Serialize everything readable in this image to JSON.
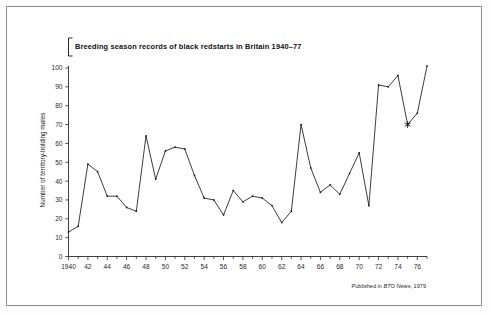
{
  "figure": {
    "title": "Breeding season records of black redstarts in Britain 1940–77",
    "credit_prefix": "Published in ",
    "credit_source": "BTO News",
    "credit_suffix": ", 1979",
    "background_color": "#ffffff",
    "frame_color": "#8e8e8e",
    "ink_color": "#111111"
  },
  "chart_data": {
    "type": "line",
    "title": "Breeding season records of black redstarts in Britain 1940–77",
    "xlabel": "",
    "ylabel": "Number of territory-holding males",
    "xlim": [
      1940,
      1977
    ],
    "ylim": [
      0,
      100
    ],
    "y_ticks": [
      0,
      10,
      20,
      30,
      40,
      50,
      60,
      70,
      80,
      90,
      100
    ],
    "x_ticks": [
      1940,
      1942,
      1944,
      1946,
      1948,
      1950,
      1952,
      1954,
      1956,
      1958,
      1960,
      1962,
      1964,
      1966,
      1968,
      1970,
      1972,
      1974,
      1976
    ],
    "x_tick_labels": [
      "1940",
      "42",
      "44",
      "46",
      "48",
      "50",
      "52",
      "54",
      "56",
      "58",
      "60",
      "62",
      "64",
      "66",
      "68",
      "70",
      "72",
      "74",
      "76"
    ],
    "x_minor_ticks_every": 1,
    "grid": false,
    "legend": false,
    "marker": "square",
    "annotations": [
      {
        "x": 1975,
        "y": 70,
        "marker": "asterisk",
        "note": "asterisk-marked data point"
      }
    ],
    "x": [
      1940,
      1941,
      1942,
      1943,
      1944,
      1945,
      1946,
      1947,
      1948,
      1949,
      1950,
      1951,
      1952,
      1953,
      1954,
      1955,
      1956,
      1957,
      1958,
      1959,
      1960,
      1961,
      1962,
      1963,
      1964,
      1965,
      1966,
      1967,
      1968,
      1969,
      1970,
      1971,
      1972,
      1973,
      1974,
      1975,
      1976,
      1977
    ],
    "values": [
      13,
      16,
      49,
      45,
      32,
      32,
      26,
      24,
      64,
      41,
      56,
      58,
      57,
      43,
      31,
      30,
      22,
      35,
      29,
      32,
      31,
      27,
      18,
      24,
      70,
      47,
      34,
      38,
      33,
      44,
      55,
      27,
      91,
      90,
      96,
      70,
      76,
      101
    ],
    "series": [
      {
        "name": "Territory-holding males",
        "values": [
          13,
          16,
          49,
          45,
          32,
          32,
          26,
          24,
          64,
          41,
          56,
          58,
          57,
          43,
          31,
          30,
          22,
          35,
          29,
          32,
          31,
          27,
          18,
          24,
          70,
          47,
          34,
          38,
          33,
          44,
          55,
          27,
          91,
          90,
          96,
          70,
          76,
          101
        ]
      }
    ]
  }
}
